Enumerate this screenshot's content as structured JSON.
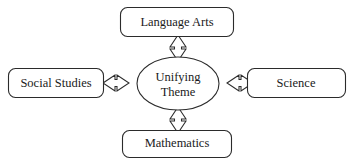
{
  "diagram": {
    "type": "hub-and-spoke",
    "background_color": "#ffffff",
    "line_color": "#2b2b2b",
    "text_color": "#1a1a1a",
    "center": {
      "shape": "ellipse",
      "line1": "Unifying",
      "line2": "Theme"
    },
    "nodes": [
      {
        "id": "language-arts",
        "label": "Language Arts",
        "position": "top"
      },
      {
        "id": "social-studies",
        "label": "Social Studies",
        "position": "left"
      },
      {
        "id": "science",
        "label": "Science",
        "position": "right"
      },
      {
        "id": "mathematics",
        "label": "Mathematics",
        "position": "bottom"
      }
    ],
    "connectors": [
      {
        "id": "connector-top",
        "from": "center",
        "to": "language-arts",
        "style": "double-headed-hollow-arrow",
        "orientation": "vertical"
      },
      {
        "id": "connector-left",
        "from": "center",
        "to": "social-studies",
        "style": "double-headed-hollow-arrow",
        "orientation": "horizontal"
      },
      {
        "id": "connector-right",
        "from": "center",
        "to": "science",
        "style": "double-headed-hollow-arrow",
        "orientation": "horizontal"
      },
      {
        "id": "connector-bottom",
        "from": "center",
        "to": "mathematics",
        "style": "double-headed-hollow-arrow",
        "orientation": "vertical"
      }
    ]
  }
}
